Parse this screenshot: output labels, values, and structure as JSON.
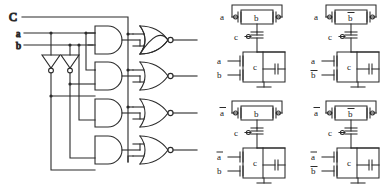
{
  "figure": {
    "background": "#ffffff",
    "ink": "#2b2b2b",
    "width": 387,
    "height": 190
  },
  "gate_schematic": {
    "name": "and-nor-gate-array",
    "inputs": [
      {
        "id": "C",
        "label": "C",
        "y": 17
      },
      {
        "id": "a",
        "label": "a",
        "y": 33
      },
      {
        "id": "b",
        "label": "b",
        "y": 45
      }
    ],
    "inverters": [
      {
        "name": "inverter-a",
        "input": "a",
        "output": "a-bar",
        "x": 50,
        "y": 62
      },
      {
        "name": "inverter-b",
        "input": "b",
        "output": "b-bar",
        "x": 70,
        "y": 62
      }
    ],
    "and_gates": [
      {
        "name": "and-gate-1",
        "y": 40,
        "inputs": [
          "a",
          "b"
        ]
      },
      {
        "name": "and-gate-2",
        "y": 76,
        "inputs": [
          "a",
          "b-bar"
        ]
      },
      {
        "name": "and-gate-3",
        "y": 113,
        "inputs": [
          "a-bar",
          "b"
        ]
      },
      {
        "name": "and-gate-4",
        "y": 150,
        "inputs": [
          "a-bar",
          "b-bar"
        ]
      }
    ],
    "nor_gates": [
      {
        "name": "nor-gate-1",
        "y": 40,
        "inputs": [
          "and-gate-1",
          "C"
        ],
        "inverted_output": true
      },
      {
        "name": "nor-gate-2",
        "y": 76,
        "inputs": [
          "and-gate-2",
          "C"
        ],
        "inverted_output": true
      },
      {
        "name": "nor-gate-3",
        "y": 113,
        "inputs": [
          "and-gate-3",
          "C"
        ],
        "inverted_output": true
      },
      {
        "name": "nor-gate-4",
        "y": 150,
        "inputs": [
          "and-gate-4",
          "C"
        ],
        "inverted_output": true
      }
    ],
    "outputs": [
      {
        "name": "output-1",
        "y": 40
      },
      {
        "name": "output-2",
        "y": 76
      },
      {
        "name": "output-3",
        "y": 113
      },
      {
        "name": "output-4",
        "y": 150
      }
    ]
  },
  "cmos_cells": [
    {
      "name": "cmos-cell-top-left",
      "row": 0,
      "col": 0,
      "pmos_parallel": [
        {
          "name": "pmos-a",
          "label": "a",
          "overbar": false
        },
        {
          "name": "pmos-b",
          "label": "b",
          "overbar": false
        }
      ],
      "pmos_series": [
        {
          "name": "pmos-c",
          "label": "c",
          "overbar": false
        }
      ],
      "nmos_series": [
        {
          "name": "nmos-a",
          "label": "a",
          "overbar": false
        },
        {
          "name": "nmos-b",
          "label": "b",
          "overbar": false
        }
      ],
      "nmos_parallel": [
        {
          "name": "nmos-c",
          "label": "c",
          "overbar": false
        }
      ]
    },
    {
      "name": "cmos-cell-top-right",
      "row": 0,
      "col": 1,
      "pmos_parallel": [
        {
          "name": "pmos-a",
          "label": "a",
          "overbar": false
        },
        {
          "name": "pmos-b",
          "label": "b",
          "overbar": true
        }
      ],
      "pmos_series": [
        {
          "name": "pmos-c",
          "label": "c",
          "overbar": false
        }
      ],
      "nmos_series": [
        {
          "name": "nmos-a",
          "label": "a",
          "overbar": false
        },
        {
          "name": "nmos-b",
          "label": "b",
          "overbar": true
        }
      ],
      "nmos_parallel": [
        {
          "name": "nmos-c",
          "label": "c",
          "overbar": false
        }
      ]
    },
    {
      "name": "cmos-cell-bottom-left",
      "row": 1,
      "col": 0,
      "pmos_parallel": [
        {
          "name": "pmos-a",
          "label": "a",
          "overbar": true
        },
        {
          "name": "pmos-b",
          "label": "b",
          "overbar": false
        }
      ],
      "pmos_series": [
        {
          "name": "pmos-c",
          "label": "c",
          "overbar": false
        }
      ],
      "nmos_series": [
        {
          "name": "nmos-a",
          "label": "a",
          "overbar": true
        },
        {
          "name": "nmos-b",
          "label": "b",
          "overbar": false
        }
      ],
      "nmos_parallel": [
        {
          "name": "nmos-c",
          "label": "c",
          "overbar": false
        }
      ]
    },
    {
      "name": "cmos-cell-bottom-right",
      "row": 1,
      "col": 1,
      "pmos_parallel": [
        {
          "name": "pmos-a",
          "label": "a",
          "overbar": true
        },
        {
          "name": "pmos-b",
          "label": "b",
          "overbar": true
        }
      ],
      "pmos_series": [
        {
          "name": "pmos-c",
          "label": "c",
          "overbar": false
        }
      ],
      "nmos_series": [
        {
          "name": "nmos-a",
          "label": "a",
          "overbar": true
        },
        {
          "name": "nmos-b",
          "label": "b",
          "overbar": true
        }
      ],
      "nmos_parallel": [
        {
          "name": "nmos-c",
          "label": "c",
          "overbar": false
        }
      ]
    }
  ]
}
